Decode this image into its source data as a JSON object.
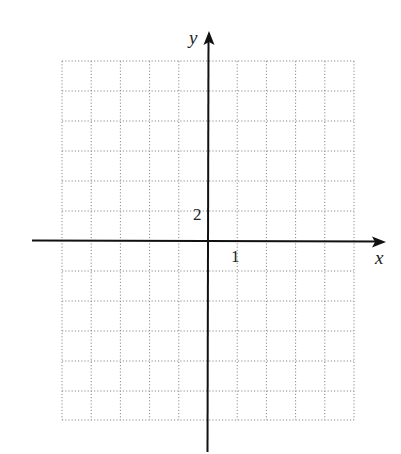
{
  "diagram": {
    "type": "coordinate-grid",
    "x_axis": {
      "label": "x",
      "tick_label": "1",
      "tick_value": 1
    },
    "y_axis": {
      "label": "y",
      "tick_label": "2",
      "tick_value": 2
    },
    "grid": {
      "columns": 10,
      "rows": 12,
      "columns_left_of_origin": 5,
      "rows_above_origin": 6,
      "style": "dotted"
    },
    "colors": {
      "axis": "#111111",
      "grid": "#8a8a8a",
      "text": "#222222"
    }
  }
}
